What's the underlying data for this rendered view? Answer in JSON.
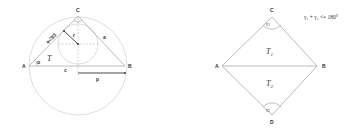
{
  "left_figure": {
    "vertices": {
      "A": "A",
      "B": "B",
      "C": "C"
    },
    "side_labels": {
      "a": "a",
      "c": "c",
      "p": "p",
      "r": "r"
    },
    "area_label": "T",
    "angle_label": "α",
    "side_b_label": "a√3/3"
  },
  "right_figure": {
    "vertices": {
      "A": "A",
      "B": "B",
      "C": "C",
      "D": "D"
    },
    "area_labels": [
      "T",
      "T"
    ],
    "area_subscripts": [
      "1",
      "2"
    ],
    "angle_labels": [
      "γ",
      "γ"
    ],
    "angle_subscripts": [
      "1",
      "2"
    ],
    "formula": "γ₁ + γ₂ <= 180°"
  },
  "colors": {
    "line": "#9a9a9a",
    "dark": "#333333",
    "circle": "#c8c8c8"
  }
}
